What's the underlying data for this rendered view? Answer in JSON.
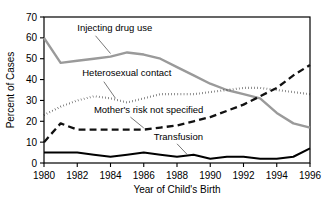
{
  "chart_data": {
    "type": "line",
    "title": "",
    "xlabel": "Year of Child's Birth",
    "ylabel": "Percent of Cases",
    "xlim": [
      1980,
      1996
    ],
    "ylim": [
      0,
      70
    ],
    "xticks": [
      1980,
      1982,
      1984,
      1986,
      1988,
      1990,
      1992,
      1994,
      1996
    ],
    "yticks": [
      0,
      10,
      20,
      30,
      40,
      50,
      60,
      70
    ],
    "grid": false,
    "legend_position": "inline-annotations",
    "x": [
      1980,
      1981,
      1982,
      1983,
      1984,
      1985,
      1986,
      1987,
      1988,
      1989,
      1990,
      1991,
      1992,
      1993,
      1994,
      1995,
      1996
    ],
    "series": [
      {
        "name": "Injecting drug use",
        "label": "Injecting drug use",
        "color": "#9a9a9a",
        "style": "solid",
        "width": 2.4,
        "values": [
          60,
          48,
          49,
          50,
          51,
          53,
          52,
          50,
          46,
          42,
          38,
          35,
          33,
          31,
          24,
          19,
          17
        ],
        "label_x": 1982.0,
        "label_y": 63.5,
        "leader": [
          [
            1983.1,
            61.0
          ],
          [
            1984.0,
            52.5
          ]
        ]
      },
      {
        "name": "Heterosexual contact",
        "label": "Heterosexual contact",
        "color": "#111111",
        "style": "dotted",
        "width": 2.1,
        "values": [
          23,
          27,
          30,
          32,
          31,
          29,
          31,
          33,
          33,
          33,
          34,
          35,
          36,
          36,
          35,
          34,
          33
        ],
        "label_x": 1982.3,
        "label_y": 41.5,
        "leader": [
          [
            1983.6,
            39.0
          ],
          [
            1984.3,
            31.0
          ]
        ]
      },
      {
        "name": "Mother's risk not specified",
        "label": "Mother's risk not specified",
        "color": "#111111",
        "style": "dashed",
        "width": 2.3,
        "values": [
          10,
          19,
          16,
          16,
          16,
          16,
          16,
          17,
          18,
          20,
          22,
          25,
          28,
          32,
          36,
          42,
          47
        ],
        "label_x": 1983.0,
        "label_y": 24.0,
        "leader": [
          [
            1985.2,
            22.0
          ],
          [
            1986.0,
            16.8
          ]
        ]
      },
      {
        "name": "Transfusion",
        "label": "Transfusion",
        "color": "#000000",
        "style": "solid",
        "width": 2.0,
        "values": [
          5,
          5,
          5,
          4,
          3,
          4,
          5,
          4,
          3,
          4,
          2,
          3,
          3,
          2,
          2,
          3,
          7
        ],
        "label_x": 1986.6,
        "label_y": 11.0,
        "leader": [
          [
            1988.0,
            9.2
          ],
          [
            1988.6,
            4.2
          ]
        ]
      }
    ]
  }
}
